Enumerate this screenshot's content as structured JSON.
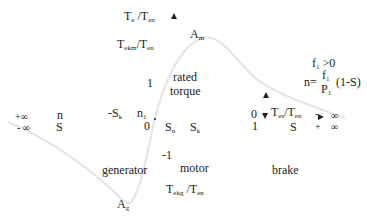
{
  "axes": {
    "y_axis_label": {
      "main": "T",
      "sub1": "e",
      "sep": " /T",
      "sub2": "en"
    },
    "y_max_label": {
      "main": "T",
      "sub1": "ekm",
      "sep": "/T",
      "sub2": "en"
    },
    "y_min_label": {
      "main": "T",
      "sub1": "ekg",
      "sep": " /T",
      "sub2": "en"
    },
    "y_right_label": {
      "main": "T",
      "sub1": "es",
      "sep": "/T",
      "sub2": "en"
    },
    "one": "1",
    "minus_one": "-1",
    "origin_zero": "0",
    "right_zero": "0",
    "right_one": "1",
    "n1_main": "n",
    "n1_sub": "1",
    "neg_sk": "-S",
    "neg_sk_sub": "k",
    "sn_main": "S",
    "sn_sub": "n",
    "sk_main": "S",
    "sk_sub": "k"
  },
  "left_limits": {
    "plus_inf": "+∞",
    "minus_inf": "- ∞",
    "n": "n",
    "s": "S"
  },
  "right_limits": {
    "minus": "-",
    "inf_top": "∞",
    "plus": "+",
    "inf_bottom": "∞",
    "s": "S"
  },
  "points": {
    "am_main": "A",
    "am_sub": "m",
    "ag_main": "A",
    "ag_sub": "g"
  },
  "regions": {
    "rated_line1": "rated",
    "rated_line2": "torque",
    "generator": "generator",
    "motor": "motor",
    "brake": "brake"
  },
  "formula": {
    "cond_main": "f",
    "cond_sub": "1",
    "cond_rest": " >0",
    "n_eq": "n=",
    "num_main": "f",
    "num_sub": "1",
    "den_main": "P",
    "den_sub": "1",
    "tail": "(1-S)"
  },
  "colors": {
    "curve": "#e6e6e6",
    "text": "#222222"
  }
}
